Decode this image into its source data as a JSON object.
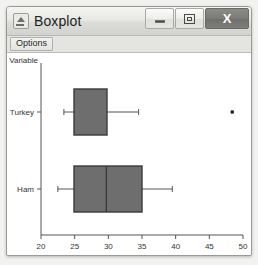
{
  "window": {
    "title": "Boxplot",
    "icon": "chart-app-icon",
    "controls": {
      "minimize": {
        "name": "minimize-icon",
        "label": "–"
      },
      "maximize": {
        "name": "maximize-icon",
        "label": "□"
      },
      "close": {
        "name": "close-icon",
        "label": "X"
      }
    }
  },
  "menubar": {
    "items": [
      {
        "name": "menu-options",
        "label": "Options"
      }
    ]
  },
  "chart_data": {
    "type": "boxplot",
    "title": "",
    "xlabel": "",
    "ylabel": "Variable",
    "orientation": "horizontal",
    "grid": false,
    "legend": false,
    "xlim": [
      20,
      50
    ],
    "xticks": [
      20,
      25,
      30,
      35,
      40,
      45,
      50
    ],
    "xtick_labels": [
      "20",
      "25",
      "30",
      "35",
      "40",
      "45",
      "50"
    ],
    "categories": [
      "Turkey",
      "Ham"
    ],
    "axis_corner_label": "Variable",
    "boxes": [
      {
        "category": "Turkey",
        "whisker_low": 23.4,
        "q1": 24.9,
        "median": 29.8,
        "q3": 29.8,
        "whisker_high": 34.5,
        "outliers": [
          48.4
        ]
      },
      {
        "category": "Ham",
        "whisker_low": 22.5,
        "q1": 24.9,
        "median": 29.7,
        "q3": 35.0,
        "whisker_high": 39.5,
        "outliers": []
      }
    ],
    "colors": {
      "box_fill": "#6e6e6e",
      "box_edge": "#3a3a3a",
      "whisker": "#555555",
      "outlier": "#1a1a1a",
      "axis": "#555555",
      "tick_label": "#333333",
      "plot_background": "#ffffff"
    }
  }
}
